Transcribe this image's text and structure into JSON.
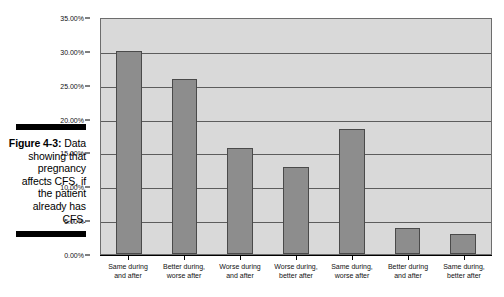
{
  "figure": {
    "label": "Figure 4-3:",
    "caption_lines": [
      "Data",
      "showing",
      "that",
      "pregnancy",
      "affects CFS,",
      "if the patient",
      "already",
      "has CFS."
    ]
  },
  "colors": {
    "bar_fill": "#8d8d8d",
    "bar_border": "#4a4a4a",
    "plot_background": "#d9d9d9",
    "gridline": "#5d5d5d",
    "axis": "#000000",
    "rule": "#000000"
  },
  "chart_data": {
    "type": "bar",
    "title": "",
    "xlabel": "",
    "ylabel": "",
    "categories": [
      "Same during and after",
      "Better during, worse after",
      "Worse during and after",
      "Worse during, better after",
      "Same during, worse after",
      "Better during and after",
      "Same during, better after"
    ],
    "category_lines": [
      [
        "Same during",
        "and after"
      ],
      [
        "Better during,",
        "worse after"
      ],
      [
        "Worse during",
        "and after"
      ],
      [
        "Worse during,",
        "better after"
      ],
      [
        "Same during,",
        "worse after"
      ],
      [
        "Better during",
        "and after"
      ],
      [
        "Same during,",
        "better after"
      ]
    ],
    "values": [
      30.0,
      25.8,
      15.7,
      12.9,
      18.4,
      3.9,
      2.9
    ],
    "ylim": [
      0,
      35
    ],
    "ytick_values": [
      0,
      5,
      10,
      15,
      20,
      25,
      30,
      35
    ],
    "ytick_labels": [
      "0.00%",
      "5.00%",
      "10.00%",
      "15.00%",
      "20.00%",
      "25.00%",
      "30.00%",
      "35.00%"
    ],
    "grid": true,
    "legend": "none"
  }
}
